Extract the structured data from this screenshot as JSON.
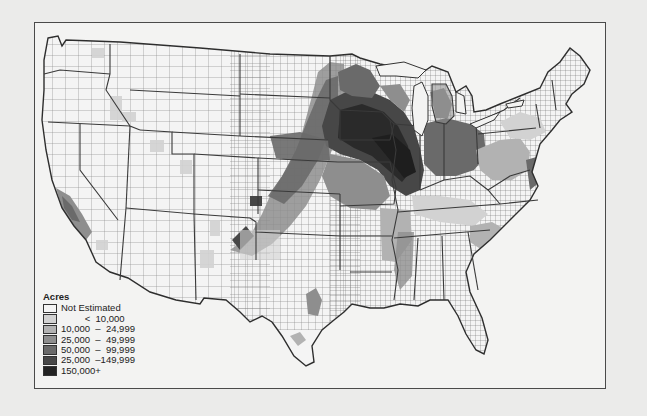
{
  "map": {
    "subject": "County-level acreage choropleth of the contiguous United States",
    "legend": {
      "title": "Acres",
      "items": [
        {
          "label": "Not Estimated",
          "color": "#f4f4f4"
        },
        {
          "label": "         <  10,000",
          "color": "#d2d2d2"
        },
        {
          "label": "10,000  –  24,999",
          "color": "#b2b2b2"
        },
        {
          "label": "25,000  –  49,999",
          "color": "#8e8e8e"
        },
        {
          "label": "50,000  –  99,999",
          "color": "#6a6a6a"
        },
        {
          "label": "25,000  –149,999",
          "color": "#474747"
        },
        {
          "label": "150,000+",
          "color": "#232323"
        }
      ]
    },
    "colors": {
      "background": "#ebebea",
      "frame_border": "#4a4a4a",
      "land_base": "#f4f4f4",
      "county_lines": "#6f6f6f",
      "state_lines": "#3a3a3a"
    }
  }
}
